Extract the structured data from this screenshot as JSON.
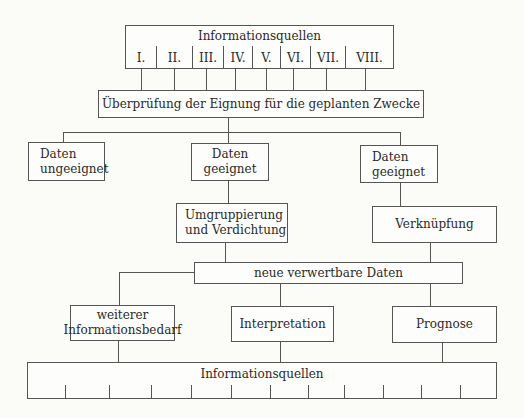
{
  "diagram": {
    "top_source_box": {
      "title": "Informationsquellen",
      "sources": [
        "I.",
        "II.",
        "III.",
        "IV.",
        "V.",
        "VI.",
        "VII.",
        "VIII."
      ]
    },
    "check_box": "Überprüfung der Eignung für die geplanten Zwecke",
    "branches": {
      "unsuitable": "Daten ungeeignet",
      "suitable_1": "Daten geeignet",
      "suitable_2": "Daten geeignet"
    },
    "processing": {
      "regroup": "Umgruppierung und Verdichtung",
      "link": "Verknüpfung"
    },
    "new_data": "neue verwertbare Daten",
    "outputs": {
      "need": "weiterer Informationsbedarf",
      "interpretation": "Interpretation",
      "forecast": "Prognose"
    },
    "bottom_source_box": {
      "title": "Informationsquellen",
      "cell_count": 12
    },
    "colors": {
      "line": "#555555",
      "background": "#fbfbf8",
      "text": "#2a2a2a"
    }
  }
}
